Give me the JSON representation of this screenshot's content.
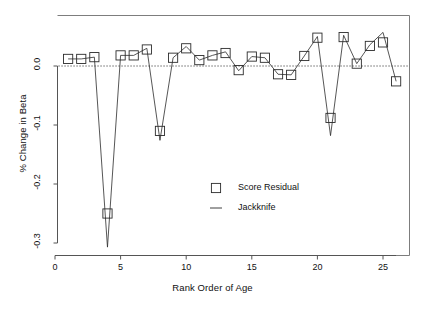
{
  "chart_data": {
    "type": "scatter",
    "title": "",
    "xlabel": "Rank Order of Age",
    "ylabel": "% Change in Beta",
    "xlim": [
      0,
      27.2
    ],
    "ylim": [
      -0.318,
      0.045
    ],
    "xticks": [
      0,
      5,
      10,
      15,
      20,
      25
    ],
    "xtick_labels": [
      "0",
      "5",
      "10",
      "15",
      "20",
      "25"
    ],
    "yticks": [
      0.0,
      -0.1,
      -0.2,
      -0.3
    ],
    "ytick_labels": [
      "0.0",
      "-0.1",
      "-0.2",
      "-0.3"
    ],
    "grid": false,
    "zero_reference_line": 0.0,
    "zero_line_style": "dotted",
    "legend_position": "center",
    "legend": [
      {
        "label": "Score Residual",
        "marker": "square"
      },
      {
        "label": "Jackknife",
        "marker": "line"
      }
    ],
    "x": [
      1,
      2,
      3,
      4,
      5,
      6,
      7,
      8,
      9,
      10,
      11,
      12,
      13,
      14,
      15,
      16,
      17,
      18,
      19,
      20,
      21,
      22,
      23,
      24,
      25,
      26
    ],
    "series": [
      {
        "name": "Score Residual",
        "marker": "square",
        "values": [
          0.012,
          0.012,
          0.015,
          -0.25,
          0.018,
          0.018,
          0.028,
          -0.11,
          0.014,
          0.03,
          0.01,
          0.018,
          0.022,
          -0.007,
          0.016,
          0.014,
          -0.014,
          -0.015,
          0.017,
          0.048,
          -0.088,
          0.049,
          0.004,
          0.034,
          0.04,
          -0.026
        ]
      },
      {
        "name": "Jackknife",
        "marker": "line",
        "values": [
          0.012,
          0.012,
          0.015,
          -0.307,
          0.018,
          0.018,
          0.03,
          -0.126,
          0.014,
          0.033,
          0.01,
          0.018,
          0.024,
          -0.008,
          0.016,
          0.014,
          -0.014,
          -0.015,
          0.017,
          0.05,
          -0.118,
          0.052,
          0.004,
          0.036,
          0.057,
          -0.026
        ]
      }
    ]
  },
  "axes": {
    "x_title": "Rank Order of Age",
    "y_title": "% Change in Beta"
  }
}
